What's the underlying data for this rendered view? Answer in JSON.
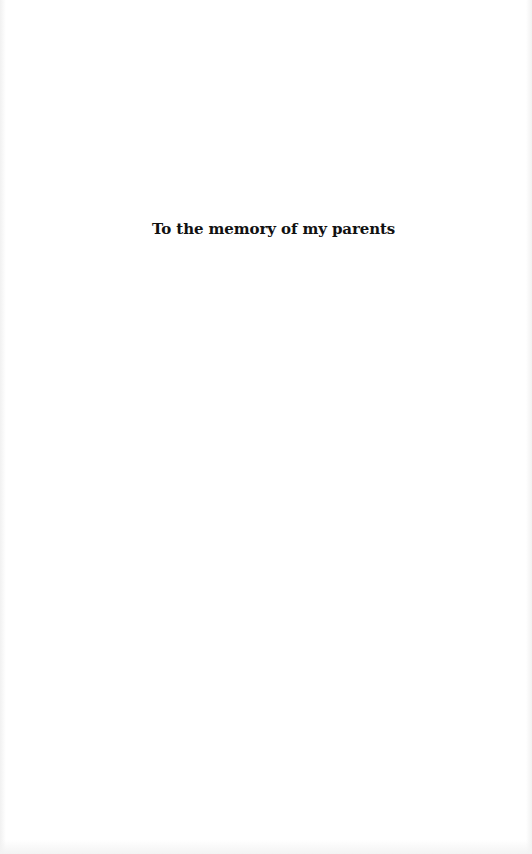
{
  "page": {
    "type": "dedication",
    "text": "To the memory of my parents",
    "colors": {
      "background": "#ffffff",
      "text": "#111111"
    }
  }
}
